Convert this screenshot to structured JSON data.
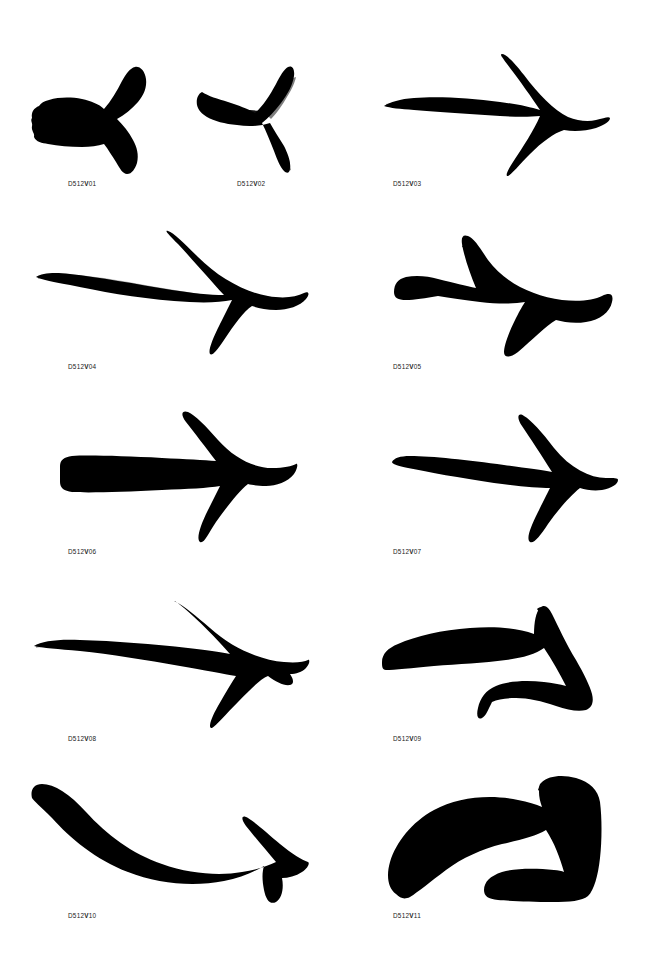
{
  "page": {
    "background_color": "#ffffff",
    "ink_color": "#000000",
    "width": 650,
    "height": 959,
    "kind": "glyph-specimen-sheet"
  },
  "labels": {
    "prefix": "D512",
    "bold_part": "V",
    "items": [
      {
        "id": "a01",
        "prefix": "D512",
        "bold": "V",
        "number": "01",
        "full": "D512V01",
        "x": 68,
        "y": 185
      },
      {
        "id": "a02",
        "prefix": "D512",
        "bold": "V",
        "number": "02",
        "full": "D512V02",
        "x": 237,
        "y": 185
      },
      {
        "id": "a03",
        "prefix": "D512",
        "bold": "V",
        "number": "03",
        "full": "D512V03",
        "x": 393,
        "y": 185
      },
      {
        "id": "a04",
        "prefix": "D512",
        "bold": "V",
        "number": "04",
        "full": "D512V04",
        "x": 68,
        "y": 368
      },
      {
        "id": "a05",
        "prefix": "D512",
        "bold": "V",
        "number": "05",
        "full": "D512V05",
        "x": 393,
        "y": 368
      },
      {
        "id": "a06",
        "prefix": "D512",
        "bold": "V",
        "number": "06",
        "full": "D512V06",
        "x": 68,
        "y": 553
      },
      {
        "id": "a07",
        "prefix": "D512",
        "bold": "V",
        "number": "07",
        "full": "D512V07",
        "x": 393,
        "y": 553
      },
      {
        "id": "a08",
        "prefix": "D512",
        "bold": "V",
        "number": "08",
        "full": "D512V08",
        "x": 68,
        "y": 740
      },
      {
        "id": "a09",
        "prefix": "D512",
        "bold": "V",
        "number": "09",
        "full": "D512V09",
        "x": 393,
        "y": 740
      },
      {
        "id": "a10",
        "prefix": "D512",
        "bold": "V",
        "number": "10",
        "full": "D512V10",
        "x": 68,
        "y": 917
      },
      {
        "id": "a11",
        "prefix": "D512",
        "bold": "V",
        "number": "11",
        "full": "D512V11",
        "x": 393,
        "y": 917
      }
    ]
  },
  "arrows": [
    {
      "id": "a01",
      "label": "D512V01",
      "description": "short stubby brush arrow, blunt ragged tail, tall angular chevron head",
      "box": {
        "x": 28,
        "y": 46,
        "w": 130,
        "h": 128
      }
    },
    {
      "id": "a02",
      "label": "D512V02",
      "description": "dry-brush streaky arrow, striated shaft, chevron head sweeping down-right",
      "box": {
        "x": 196,
        "y": 50,
        "w": 128,
        "h": 124
      }
    },
    {
      "id": "a03",
      "label": "D512V03",
      "description": "long needle-tapered shaft with wide open V arrowhead",
      "box": {
        "x": 382,
        "y": 54,
        "w": 228,
        "h": 122
      }
    },
    {
      "id": "a04",
      "label": "D512V04",
      "description": "heavy solid brush arrow, gently curved shaft, large swept filled head",
      "box": {
        "x": 32,
        "y": 230,
        "w": 278,
        "h": 126
      }
    },
    {
      "id": "a05",
      "label": "D512V05",
      "description": "chunky blocky arrow, uniform thick strokes, broad triangular head",
      "box": {
        "x": 392,
        "y": 234,
        "w": 222,
        "h": 124
      }
    },
    {
      "id": "a06",
      "label": "D512V06",
      "description": "straight even-width shaft with clean bold V head",
      "box": {
        "x": 58,
        "y": 410,
        "w": 240,
        "h": 134
      }
    },
    {
      "id": "a07",
      "label": "D512V07",
      "description": "slim slightly tapered shaft with narrow pointed V head",
      "box": {
        "x": 390,
        "y": 410,
        "w": 228,
        "h": 134
      }
    },
    {
      "id": "a08",
      "label": "D512V08",
      "description": "tapered shaft with very large swept-back wing-like head",
      "box": {
        "x": 32,
        "y": 600,
        "w": 278,
        "h": 128
      }
    },
    {
      "id": "a09",
      "label": "D512V09",
      "description": "strongly arched curved shaft, head aimed down-right, open crescent",
      "box": {
        "x": 380,
        "y": 598,
        "w": 232,
        "h": 130
      }
    },
    {
      "id": "a10",
      "label": "D512V10",
      "description": "long swooping U curve from upper-left rising to a head at upper-right",
      "box": {
        "x": 28,
        "y": 774,
        "w": 282,
        "h": 130
      }
    },
    {
      "id": "a11",
      "label": "D512V11",
      "description": "very heavy curved shaft ending in a massive blocky square arrowhead",
      "box": {
        "x": 386,
        "y": 770,
        "w": 228,
        "h": 132
      }
    }
  ]
}
